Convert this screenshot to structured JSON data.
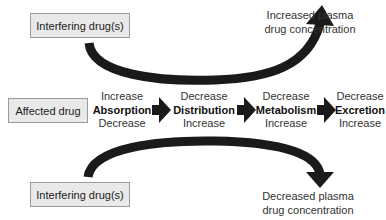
{
  "interfering_top": {
    "label": "Interfering drug(s)"
  },
  "interfering_bottom": {
    "label": "Interfering drug(s)"
  },
  "affected": {
    "label": "Affected drug"
  },
  "outcome_top": {
    "line1": "Increased plasma",
    "line2": "drug concentration"
  },
  "outcome_bottom": {
    "line1": "Decreased plasma",
    "line2": "drug concentration"
  },
  "stages": [
    {
      "top": "Increase",
      "name": "Absorption",
      "bottom": "Decrease"
    },
    {
      "top": "Decrease",
      "name": "Distribution",
      "bottom": "Increase"
    },
    {
      "top": "Decrease",
      "name": "Metabolism",
      "bottom": "Increase"
    },
    {
      "top": "Decrease",
      "name": "Excretion",
      "bottom": "Increase"
    }
  ],
  "colors": {
    "arrow": "#1a1a1a",
    "box_fill": "#e9e9e9",
    "box_border": "#9a9a9a"
  }
}
